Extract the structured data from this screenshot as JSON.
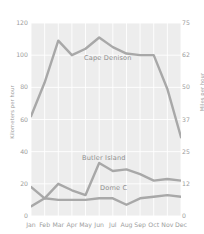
{
  "chart_data": {
    "type": "line",
    "title": "",
    "subtitle": "",
    "xlabel": "",
    "ylabel": "Kilometers per hour",
    "ylabel_right": "Miles per hour",
    "categories": [
      "Jan",
      "Feb",
      "Mar",
      "Apr",
      "May",
      "Jun",
      "Jul",
      "Aug",
      "Sep",
      "Oct",
      "Nov",
      "Dec"
    ],
    "ylim": [
      0,
      120
    ],
    "yticks": [
      0,
      20,
      40,
      60,
      80,
      100,
      120
    ],
    "ylim_right": [
      0,
      75
    ],
    "yticks_right": [
      0,
      12,
      25,
      37,
      50,
      62,
      75
    ],
    "grid": true,
    "legend_position": "inline-labels",
    "series": [
      {
        "name": "Cape Denison",
        "color": "#a8a8a8",
        "values": [
          62,
          83,
          109,
          100,
          104,
          111,
          105,
          101,
          100,
          100,
          79,
          49
        ]
      },
      {
        "name": "Butler Island",
        "color": "#a8a8a8",
        "values": [
          18,
          11,
          20,
          16,
          13,
          33,
          28,
          29,
          26,
          22,
          23,
          22
        ]
      },
      {
        "name": "Dome C",
        "color": "#a8a8a8",
        "values": [
          6,
          11,
          10,
          10,
          10,
          11,
          11,
          7,
          11,
          12,
          13,
          12
        ]
      }
    ]
  },
  "axes": {
    "left_title": "Kilometers per hour",
    "right_title": "Miles per hour",
    "left_ticks": [
      "120",
      "100",
      "80",
      "60",
      "40",
      "20",
      "0"
    ],
    "right_ticks": [
      "75",
      "62",
      "50",
      "37",
      "25",
      "12",
      "0"
    ],
    "x_ticks": [
      "Jan",
      "Feb",
      "Mar",
      "Apr",
      "May",
      "Jun",
      "Jul",
      "Aug",
      "Sep",
      "Oct",
      "Nov",
      "Dec"
    ]
  },
  "series_labels": {
    "cape_denison": "Cape Denison",
    "butler_island": "Butler Island",
    "dome_c": "Dome C"
  },
  "colors": {
    "line": "#a8a8a8",
    "plot_background": "#ededed",
    "gridline": "#ffffff",
    "text": "#9d9d9d"
  }
}
